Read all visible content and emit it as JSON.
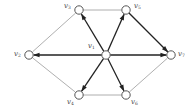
{
  "diagram": {
    "type": "directed-graph",
    "nodes": [
      {
        "id": "v1",
        "label": "v",
        "sub": "1",
        "x": 106,
        "y": 55,
        "label_x": 88,
        "label_y": 43
      },
      {
        "id": "v2",
        "label": "v",
        "sub": "2",
        "x": 29,
        "y": 55,
        "label_x": 14,
        "label_y": 51
      },
      {
        "id": "v3",
        "label": "v",
        "sub": "3",
        "x": 79,
        "y": 10,
        "label_x": 64,
        "label_y": 3
      },
      {
        "id": "v4",
        "label": "v",
        "sub": "4",
        "x": 79,
        "y": 95,
        "label_x": 67,
        "label_y": 99
      },
      {
        "id": "v5",
        "label": "v",
        "sub": "5",
        "x": 126,
        "y": 10,
        "label_x": 134,
        "label_y": 3
      },
      {
        "id": "v6",
        "label": "v",
        "sub": "6",
        "x": 126,
        "y": 95,
        "label_x": 131,
        "label_y": 99
      },
      {
        "id": "v7",
        "label": "v",
        "sub": "7",
        "x": 171,
        "y": 55,
        "label_x": 178,
        "label_y": 51
      }
    ],
    "edges": [
      {
        "from": "v1",
        "to": "v3",
        "directed": true
      },
      {
        "from": "v1",
        "to": "v5",
        "directed": true
      },
      {
        "from": "v1",
        "to": "v2",
        "directed": true
      },
      {
        "from": "v1",
        "to": "v7",
        "directed": true
      },
      {
        "from": "v1",
        "to": "v4",
        "directed": true
      },
      {
        "from": "v1",
        "to": "v6",
        "directed": true
      },
      {
        "from": "v5",
        "to": "v7",
        "directed": true
      },
      {
        "from": "v3",
        "to": "v5",
        "directed": false
      },
      {
        "from": "v3",
        "to": "v2",
        "directed": false
      },
      {
        "from": "v2",
        "to": "v4",
        "directed": false
      },
      {
        "from": "v4",
        "to": "v6",
        "directed": false
      },
      {
        "from": "v6",
        "to": "v7",
        "directed": false
      }
    ],
    "colors": {
      "thick_edge": "#222222",
      "thin_edge": "#9a9a9a",
      "node_stroke": "#555555",
      "node_fill": "#ffffff"
    }
  }
}
